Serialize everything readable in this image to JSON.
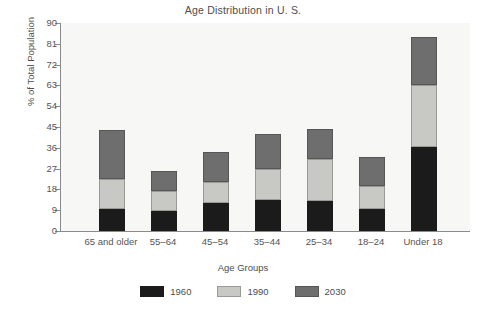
{
  "chart_data": {
    "type": "bar",
    "subtype": "stacked-bar",
    "title": "Age Distribution in U. S.",
    "xlabel": "Age Groups",
    "ylabel": "% of Total Population",
    "categories": [
      "65 and older",
      "55–64",
      "45–54",
      "35–44",
      "25–34",
      "18–24",
      "Under 18"
    ],
    "series": [
      {
        "name": "1960",
        "color": "#1b1b1b",
        "values": [
          9.5,
          8.5,
          12,
          13.5,
          13,
          9.5,
          36.5
        ]
      },
      {
        "name": "1990",
        "color": "#c8c8c4",
        "values": [
          13,
          9,
          9,
          13.5,
          18,
          10,
          26.5
        ]
      },
      {
        "name": "2030",
        "color": "#6e6e6e",
        "values": [
          21,
          8.5,
          13,
          15,
          13,
          12.5,
          21
        ]
      }
    ],
    "stack_totals": [
      43.5,
      26,
      34,
      42,
      44,
      32,
      84
    ],
    "ylim": [
      0,
      90
    ],
    "yticks": [
      0,
      9,
      18,
      27,
      36,
      45,
      54,
      63,
      72,
      81,
      90
    ],
    "ytick_labels": [
      "0",
      "9",
      "18",
      "27",
      "36",
      "45",
      "54",
      "63",
      "72",
      "81",
      "90"
    ],
    "grid": false,
    "legend_position": "bottom",
    "legend_entries": [
      "1960",
      "1990",
      "2030"
    ],
    "plot_background": "#f7f7f5",
    "axis_color": "#8a8a8a",
    "text_color": "#4d4d4d"
  },
  "legend": {
    "items": [
      {
        "label": "1960",
        "swatch": "legend-swatch-1960"
      },
      {
        "label": "1990",
        "swatch": "legend-swatch-1990"
      },
      {
        "label": "2030",
        "swatch": "legend-swatch-2030"
      }
    ]
  }
}
